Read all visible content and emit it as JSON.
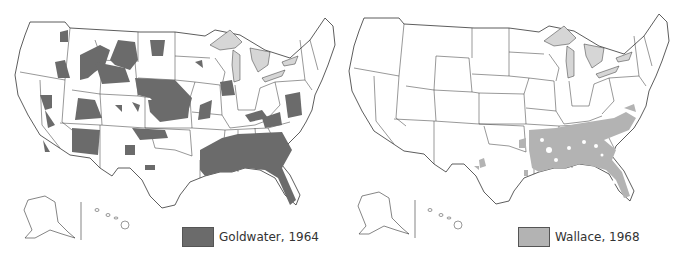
{
  "maps": [
    {
      "id": "goldwater",
      "legend": {
        "label": "Goldwater, 1964",
        "color": "#6b6b6b"
      }
    },
    {
      "id": "wallace",
      "legend": {
        "label": "Wallace, 1968",
        "color": "#b3b3b3"
      }
    }
  ],
  "colors": {
    "lakes": "#d6d6d6",
    "outline": "#333333",
    "background": "#ffffff"
  }
}
